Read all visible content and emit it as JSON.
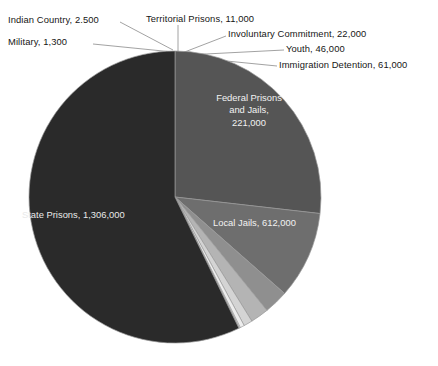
{
  "chart_data": {
    "type": "pie",
    "title": "",
    "subtitle": "",
    "units": "people",
    "total": 2282800,
    "legend_position": "none",
    "grid": false,
    "categories": [
      "State Prisons",
      "Local Jails",
      "Federal Prisons and Jails",
      "Immigration Detention",
      "Youth",
      "Involuntary Commitment",
      "Territorial Prisons",
      "Indian Country",
      "Military"
    ],
    "values": [
      1306000,
      612000,
      221000,
      61000,
      46000,
      22000,
      11000,
      2500,
      1300
    ],
    "value_labels": [
      "1,306,000",
      "612,000",
      "221,000",
      "61,000",
      "46,000",
      "22,000",
      "11,000",
      "2,500",
      "1,300"
    ],
    "slice_colors": [
      "#2a2a2a",
      "#555555",
      "#6e6e6e",
      "#8f8f8f",
      "#b4b4b4",
      "#d4d4d4",
      "#ededed",
      "#f7f7f7",
      "#fbfbfb"
    ],
    "annotations": [
      {
        "name": "indian-country",
        "text": "Indian Country, 2.500"
      },
      {
        "name": "military",
        "text": "Military, 1,300"
      },
      {
        "name": "territorial-prisons",
        "text": "Territorial Prisons, 11,000"
      },
      {
        "name": "involuntary-commitment",
        "text": "Involuntary Commitment, 22,000"
      },
      {
        "name": "youth",
        "text": "Youth, 46,000"
      },
      {
        "name": "immigration-detention",
        "text": "Immigration Detention, 61,000"
      },
      {
        "name": "federal-prisons",
        "text": "Federal Prisons and Jails, 221,000"
      },
      {
        "name": "local-jails",
        "text": "Local Jails, 612,000"
      },
      {
        "name": "state-prisons",
        "text": "State Prisons, 1,306,000"
      }
    ]
  },
  "labels": {
    "indian_country": "Indian Country, 2.500",
    "military": "Military, 1,300",
    "territorial_prisons": "Territorial Prisons, 11,000",
    "involuntary_commitment": "Involuntary Commitment, 22,000",
    "youth": "Youth, 46,000",
    "immigration_detention": "Immigration Detention, 61,000",
    "federal_line1": "Federal Prisons",
    "federal_line2": "and Jails,",
    "federal_line3": "221,000",
    "local_jails": "Local Jails, 612,000",
    "state_prisons": "State Prisons, 1,306,000"
  },
  "colors": {
    "background": "#ffffff",
    "text": "#161616",
    "inner_text": "#f0f0f0",
    "leader_line": "#8a8a8a",
    "slice_stroke": "#9a9a9a"
  },
  "geometry": {
    "center_x": 175,
    "center_y": 197,
    "radius": 146
  }
}
